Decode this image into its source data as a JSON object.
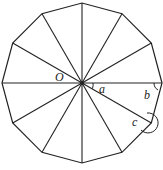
{
  "diagram": {
    "type": "regular-dodecagon",
    "sides": 12,
    "center": {
      "x": 82,
      "y": 83
    },
    "radius": 80,
    "stroke": "#222222",
    "labels": {
      "center": "O",
      "angle_a": "a",
      "angle_b": "b",
      "angle_c": "c"
    }
  }
}
